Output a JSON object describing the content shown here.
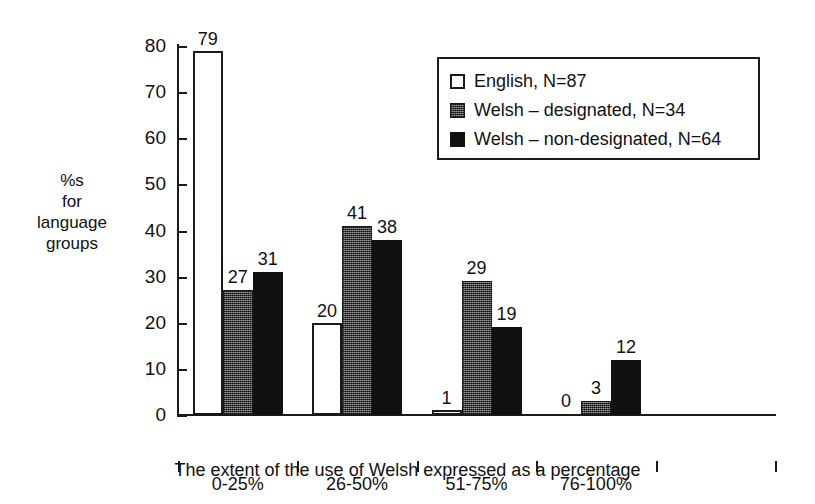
{
  "chart_data": {
    "type": "bar",
    "title": "",
    "xlabel": "The extent of the use of Welsh expressed as a percentage",
    "ylabel": "%s for language groups",
    "ylabel_lines": [
      "%s",
      "for",
      "language",
      "groups"
    ],
    "categories": [
      "0-25%",
      "26-50%",
      "51-75%",
      "76-100%"
    ],
    "series": [
      {
        "name": "English, N=87",
        "swatch": "white-outline",
        "values": [
          79,
          20,
          1,
          0
        ]
      },
      {
        "name": "Welsh – designated, N=34",
        "swatch": "dark-grey-hatched",
        "values": [
          27,
          41,
          29,
          3
        ]
      },
      {
        "name": "Welsh – non-designated, N=64",
        "swatch": "black",
        "values": [
          31,
          38,
          19,
          12
        ]
      }
    ],
    "ylim": [
      0,
      80
    ],
    "yticks": [
      0,
      10,
      20,
      30,
      40,
      50,
      60,
      70,
      80
    ],
    "ytick_labels": [
      "0",
      "10",
      "20",
      "30",
      "40",
      "50",
      "60",
      "70",
      "80"
    ],
    "grid": false,
    "legend_position": "top-right",
    "data_labels": true
  },
  "legend": {
    "entries": [
      "English, N=87",
      "Welsh – designated, N=34",
      "Welsh – non-designated, N=64"
    ]
  },
  "colors": {
    "axis": "#1a1a1a",
    "text": "#111111",
    "background": "#ffffff",
    "series_english": "#ffffff",
    "series_welsh_designated": "#4d4d4d",
    "series_welsh_non_designated": "#111111"
  }
}
